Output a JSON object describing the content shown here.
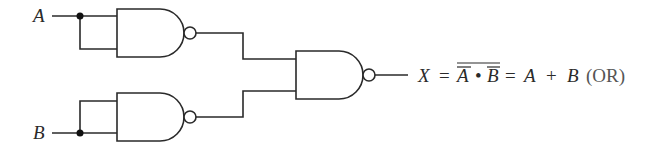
{
  "diagram": {
    "inputs": [
      {
        "label": "A"
      },
      {
        "label": "B"
      }
    ],
    "gates": [
      {
        "id": "nand-1",
        "type": "NAND",
        "inputs": [
          "A",
          "A"
        ],
        "output": "A̅"
      },
      {
        "id": "nand-2",
        "type": "NAND",
        "inputs": [
          "B",
          "B"
        ],
        "output": "B̅"
      },
      {
        "id": "nand-3",
        "type": "NAND",
        "inputs": [
          "A̅",
          "B̅"
        ],
        "output": "X"
      }
    ],
    "output": {
      "label": "X",
      "eq": "=",
      "term_a": "A",
      "dot": "•",
      "term_b": "B",
      "eq2": "=",
      "sum_a": "A",
      "plus": "+",
      "sum_b": "B",
      "note": "(OR)"
    },
    "colors": {
      "line": "#2a2a2a",
      "note": "#555555"
    }
  }
}
